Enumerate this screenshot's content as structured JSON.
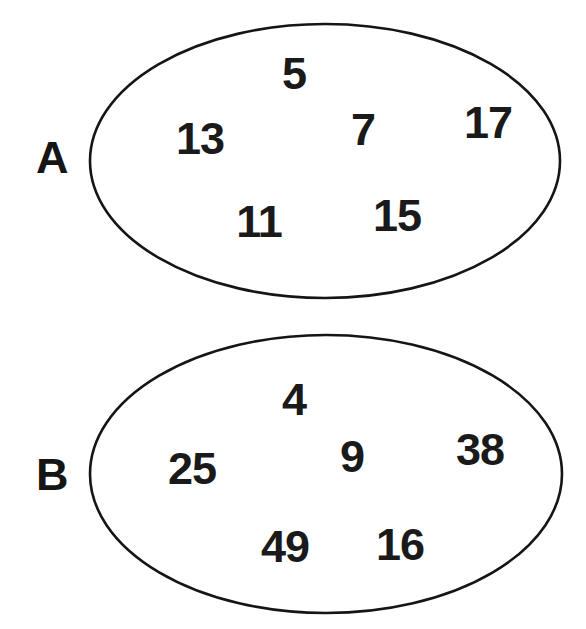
{
  "figure": {
    "type": "set-diagram",
    "background_color": "#ffffff",
    "stroke_color": "#151515",
    "text_color": "#1a1a1a"
  },
  "sets": [
    {
      "name": "set-a",
      "label": "A",
      "label_x": 52,
      "label_y": 157,
      "ellipse": {
        "cx": 325,
        "cy": 161,
        "rx": 235,
        "ry": 137
      },
      "members": [
        {
          "value": "5",
          "x": 294,
          "y": 73
        },
        {
          "value": "13",
          "x": 200,
          "y": 138
        },
        {
          "value": "7",
          "x": 363,
          "y": 129
        },
        {
          "value": "17",
          "x": 488,
          "y": 122
        },
        {
          "value": "11",
          "x": 259,
          "y": 221
        },
        {
          "value": "15",
          "x": 397,
          "y": 215
        }
      ]
    },
    {
      "name": "set-b",
      "label": "B",
      "label_x": 52,
      "label_y": 474,
      "ellipse": {
        "cx": 326,
        "cy": 474,
        "rx": 236,
        "ry": 139
      },
      "members": [
        {
          "value": "4",
          "x": 294,
          "y": 399
        },
        {
          "value": "25",
          "x": 192,
          "y": 468
        },
        {
          "value": "9",
          "x": 352,
          "y": 456
        },
        {
          "value": "38",
          "x": 480,
          "y": 449
        },
        {
          "value": "49",
          "x": 285,
          "y": 546
        },
        {
          "value": "16",
          "x": 400,
          "y": 544
        }
      ]
    }
  ],
  "chart_data": {
    "type": "table",
    "title": "",
    "series": [
      {
        "name": "A",
        "values": [
          5,
          13,
          7,
          17,
          11,
          15
        ]
      },
      {
        "name": "B",
        "values": [
          4,
          25,
          9,
          38,
          49,
          16
        ]
      }
    ]
  }
}
